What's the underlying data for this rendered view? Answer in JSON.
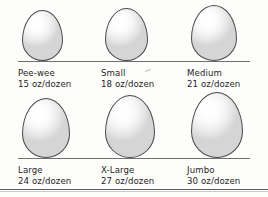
{
  "figure": {
    "title_clipped_fragments": [
      "",
      "",
      ""
    ],
    "baseline_color": "#6f6f6f",
    "egg_outline_color": "#4a4a4a",
    "egg_fill_light": "#ffffff",
    "egg_fill_shadow": "#d5d5d5",
    "text_color": "#262626",
    "background_color": "#fdfdfc",
    "bottom_rule_color": "#5c5c5c"
  },
  "chart_data": {
    "type": "table",
    "columns": [
      "Size",
      "Minimum weight"
    ],
    "unit": "oz/dozen",
    "categories": [
      "Pee-wee",
      "Small",
      "Medium",
      "Large",
      "X-Large",
      "Jumbo"
    ],
    "values": [
      15,
      18,
      21,
      24,
      27,
      30
    ],
    "xlabel": "",
    "ylabel": "oz/dozen",
    "ylim": [
      0,
      30
    ],
    "grid": false,
    "legend": "none"
  },
  "rows": [
    {
      "cells": [
        {
          "name": "Pee-wee",
          "weight": "15 oz/dozen",
          "egg_w": 41,
          "egg_h": 51
        },
        {
          "name": "Small",
          "weight": "18 oz/dozen",
          "egg_w": 43,
          "egg_h": 53
        },
        {
          "name": "Medium",
          "weight": "21 oz/dozen",
          "egg_w": 46,
          "egg_h": 56
        }
      ]
    },
    {
      "cells": [
        {
          "name": "Large",
          "weight": "24 oz/dozen",
          "egg_w": 48,
          "egg_h": 60
        },
        {
          "name": "X-Large",
          "weight": "27 oz/dozen",
          "egg_w": 50,
          "egg_h": 63
        },
        {
          "name": "Jumbo",
          "weight": "30 oz/dozen",
          "egg_w": 52,
          "egg_h": 66
        }
      ]
    }
  ]
}
